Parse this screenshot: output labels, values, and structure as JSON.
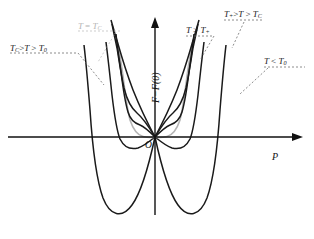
{
  "figure": {
    "kind": "landau-free-energy-diagram",
    "background": "#ffffff",
    "axes": {
      "y_label": "F−F(0)",
      "x_label": "P",
      "origin_label": "O",
      "origin_px": [
        155,
        137
      ],
      "x_axis_from": [
        8,
        137
      ],
      "x_axis_to": [
        300,
        137
      ],
      "y_axis_from": [
        155,
        215
      ],
      "y_axis_to": [
        155,
        18
      ],
      "axis_color": "#111111"
    },
    "labels": [
      {
        "id": "t-gt-tplus",
        "text_html": "T > T<sub>+</sub>",
        "x": 186,
        "y": 26,
        "color": "#1a1a1a"
      },
      {
        "id": "tplus-t-tc",
        "text_html": "T<sub>+</sub>>T > T<sub>C</sub>",
        "x": 224,
        "y": 10,
        "color": "#1a1a1a"
      },
      {
        "id": "t-eq-tc",
        "text_html": "T = T<sub>C</sub>",
        "x": 78,
        "y": 22,
        "color": "#b4b4b4"
      },
      {
        "id": "tc-t-t0",
        "text_html": "T<sub>C</sub>>T > T<sub>0</sub>",
        "x": 10,
        "y": 44,
        "color": "#1a1a1a"
      },
      {
        "id": "t-lt-t0",
        "text_html": "T < T<sub>0</sub>",
        "x": 264,
        "y": 57,
        "color": "#1a1a1a"
      }
    ],
    "curves": [
      {
        "id": "t-gt-tplus",
        "label": "T > T+",
        "color": "#1a1a1a",
        "width": 1.5,
        "description": "single parabolic minimum at P=0, steepest walls"
      },
      {
        "id": "tplus-t-tc",
        "label": "T+ > T > TC",
        "color": "#1a1a1a",
        "width": 1.5,
        "description": "global minimum at P=0 with shallow side inflection shoulders above axis"
      },
      {
        "id": "t-eq-tc",
        "label": "T = TC",
        "color": "#b4b4b4",
        "width": 1.6,
        "description": "degenerate minima: side minima touch F-F(0)=0 level, equal to P=0"
      },
      {
        "id": "tc-t-t0",
        "label": "TC > T > T0",
        "color": "#1a1a1a",
        "width": 1.5,
        "description": "side minima dip below axis, local minimum still present at P=0"
      },
      {
        "id": "t-lt-t0",
        "label": "T < T0",
        "color": "#1a1a1a",
        "width": 1.5,
        "description": "deep symmetric double well far below axis, P=0 is a maximum"
      }
    ],
    "leaders": {
      "style": "dashed",
      "color": "#6e6e6e",
      "gray_color": "#c0c0c0"
    }
  }
}
